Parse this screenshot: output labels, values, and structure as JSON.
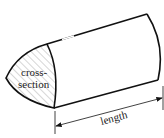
{
  "diagram": {
    "title": "",
    "labels": {
      "cross_section_line1": "cross-",
      "cross_section_line2": "section",
      "length": "length"
    },
    "colors": {
      "stroke": "#111111",
      "hatch": "#777777",
      "background": "#ffffff"
    }
  }
}
